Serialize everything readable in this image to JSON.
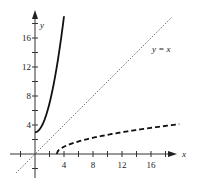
{
  "chart_data": {
    "type": "line",
    "title": "",
    "xlabel": "x",
    "ylabel": "y",
    "xlim": [
      -3.4,
      19.5
    ],
    "ylim": [
      -3.3,
      19.5
    ],
    "grid": false,
    "legend": null,
    "x_ticks_labeled": [
      4,
      8,
      12,
      16
    ],
    "y_ticks_labeled": [
      4,
      8,
      12,
      16
    ],
    "minor_tick_step": 2,
    "series": [
      {
        "name": "f(x) = x^2 + 3",
        "style": "solid",
        "domain": [
          0,
          4
        ],
        "x": [
          0,
          0.5,
          1,
          1.5,
          2,
          2.5,
          3,
          3.5,
          4
        ],
        "y": [
          3,
          3.25,
          4,
          5.25,
          7,
          9.25,
          12,
          15.25,
          19
        ]
      },
      {
        "name": "inverse: y = sqrt(x - 3)",
        "style": "dashed",
        "domain": [
          3,
          19.9
        ],
        "x": [
          3,
          3.25,
          4,
          5.25,
          7,
          9.25,
          12,
          15.25,
          19
        ],
        "y": [
          0,
          0.5,
          1,
          1.5,
          2,
          2.5,
          3,
          3.5,
          4
        ]
      },
      {
        "name": "y = x",
        "style": "dotted",
        "domain": [
          -2.6,
          18.8
        ],
        "x": [
          -2.6,
          18.8
        ],
        "y": [
          -2.6,
          18.8
        ]
      }
    ],
    "annotations": [
      {
        "text": "y = x",
        "x": 16.2,
        "y": 14
      }
    ]
  },
  "labels": {
    "x_axis": "x",
    "y_axis": "y",
    "line_label": "y = x",
    "xticks": [
      "4",
      "8",
      "12",
      "16"
    ],
    "yticks": [
      "4",
      "8",
      "12",
      "16"
    ]
  }
}
